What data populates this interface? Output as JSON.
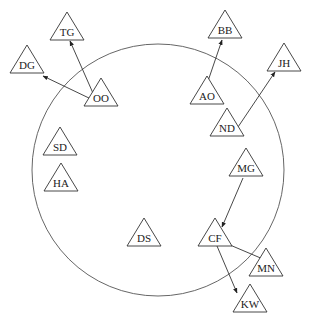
{
  "diagram": {
    "boundary": {
      "cx": 158,
      "cy": 170,
      "r": 126
    },
    "nodes": [
      {
        "id": "TG",
        "label": "TG",
        "x": 67,
        "y": 12
      },
      {
        "id": "DG",
        "label": "DG",
        "x": 27,
        "y": 45
      },
      {
        "id": "OO",
        "label": "OO",
        "x": 101,
        "y": 78
      },
      {
        "id": "BB",
        "label": "BB",
        "x": 225,
        "y": 10
      },
      {
        "id": "JH",
        "label": "JH",
        "x": 284,
        "y": 43
      },
      {
        "id": "AO",
        "label": "AO",
        "x": 207,
        "y": 76
      },
      {
        "id": "ND",
        "label": "ND",
        "x": 227,
        "y": 108
      },
      {
        "id": "SD",
        "label": "SD",
        "x": 60,
        "y": 127
      },
      {
        "id": "HA",
        "label": "HA",
        "x": 61,
        "y": 163
      },
      {
        "id": "MG",
        "label": "MG",
        "x": 246,
        "y": 148
      },
      {
        "id": "DS",
        "label": "DS",
        "x": 144,
        "y": 218
      },
      {
        "id": "CF",
        "label": "CF",
        "x": 215,
        "y": 218
      },
      {
        "id": "MN",
        "label": "MN",
        "x": 266,
        "y": 248
      },
      {
        "id": "KW",
        "label": "KW",
        "x": 250,
        "y": 284
      }
    ],
    "edges": [
      {
        "from": "OO",
        "to": "TG",
        "x1": 96,
        "y1": 100,
        "x2": 70,
        "y2": 41
      },
      {
        "from": "OO",
        "to": "DG",
        "x1": 91,
        "y1": 99,
        "x2": 43,
        "y2": 76
      },
      {
        "from": "AO",
        "to": "BB",
        "x1": 207,
        "y1": 84,
        "x2": 222,
        "y2": 40
      },
      {
        "from": "ND",
        "to": "JH",
        "x1": 236,
        "y1": 130,
        "x2": 275,
        "y2": 72
      },
      {
        "from": "MG",
        "to": "CF",
        "x1": 243,
        "y1": 178,
        "x2": 222,
        "y2": 227
      },
      {
        "from": "CF",
        "to": "MN",
        "x1": 230,
        "y1": 245,
        "x2": 270,
        "y2": 262
      },
      {
        "from": "CF",
        "to": "KW",
        "x1": 217,
        "y1": 246,
        "x2": 237,
        "y2": 293
      }
    ]
  }
}
